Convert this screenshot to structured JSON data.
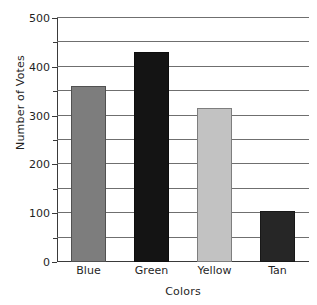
{
  "chart_data": {
    "type": "bar",
    "title": "",
    "subtitle": "",
    "xlabel": "Colors",
    "ylabel": "Number of Votes",
    "categories": [
      "Blue",
      "Green",
      "Yellow",
      "Tan"
    ],
    "values": [
      360,
      430,
      315,
      105
    ],
    "bar_colors": [
      "#7d7d7d",
      "#141414",
      "#c2c2c2",
      "#262626"
    ],
    "ylim": [
      0,
      500
    ],
    "ytick_step": 100,
    "yticks": [
      0,
      100,
      200,
      300,
      400,
      500
    ],
    "ytick_labels": [
      "0",
      "100",
      "200",
      "300",
      "400",
      "500"
    ],
    "gridlines": [
      0,
      50,
      100,
      150,
      200,
      250,
      300,
      350,
      400,
      450,
      500
    ],
    "grid": true,
    "grid_axis": "y",
    "legend": false,
    "legend_position": "none",
    "axis_color": "#3a3a3a",
    "grid_color": "#6f6f6f",
    "background": "#ffffff"
  }
}
